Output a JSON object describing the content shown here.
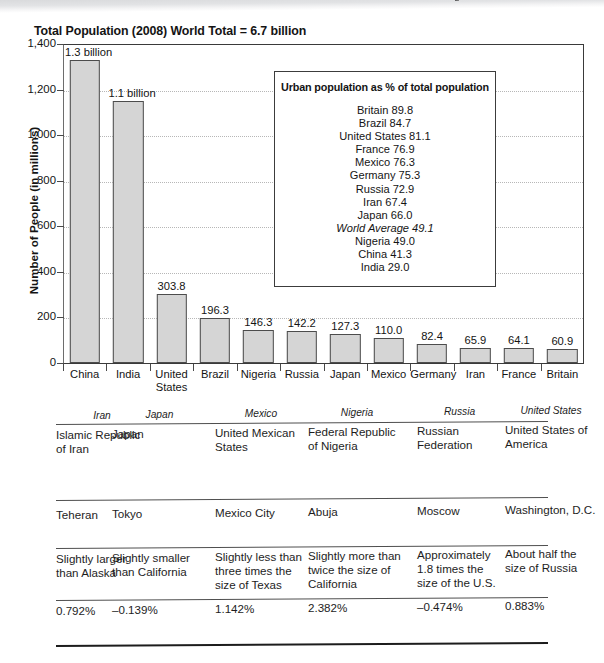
{
  "chart_data": {
    "type": "bar",
    "title": "Total Population (2008) World Total = 6.7 billion",
    "xlabel": "",
    "ylabel": "Number of People (in millions)",
    "ylim": [
      0,
      1400
    ],
    "grid": true,
    "yticks": [
      "0",
      "200",
      "400",
      "600",
      "800",
      "1,000",
      "1,200",
      "1,400"
    ],
    "ytick_values": [
      0,
      200,
      400,
      600,
      800,
      1000,
      1200,
      1400
    ],
    "categories": [
      "China",
      "India",
      "United States",
      "Brazil",
      "Nigeria",
      "Russia",
      "Japan",
      "Mexico",
      "Germany",
      "Iran",
      "France",
      "Britain"
    ],
    "values": [
      1330,
      1150,
      303.8,
      196.3,
      146.3,
      142.2,
      127.3,
      110.0,
      82.4,
      65.9,
      64.1,
      60.9
    ],
    "data_labels": [
      "1.3 billion",
      "1.1 billion",
      "303.8",
      "196.3",
      "146.3",
      "142.2",
      "127.3",
      "110.0",
      "82.4",
      "65.9",
      "64.1",
      "60.9"
    ],
    "bar_color": "#d5d5d5",
    "bar_edge_color": "#4c4c4c"
  },
  "inset": {
    "title": "Urban population as % of total population",
    "rows": [
      {
        "label": "Britain 89.8",
        "italic": false
      },
      {
        "label": "Brazil 84.7",
        "italic": false
      },
      {
        "label": "United States 81.1",
        "italic": false
      },
      {
        "label": "France 76.9",
        "italic": false
      },
      {
        "label": "Mexico 76.3",
        "italic": false
      },
      {
        "label": "Germany 75.3",
        "italic": false
      },
      {
        "label": "Russia 72.9",
        "italic": false
      },
      {
        "label": "Iran 67.4",
        "italic": false
      },
      {
        "label": "Japan 66.0",
        "italic": false
      },
      {
        "label": "World Average 49.1",
        "italic": true
      },
      {
        "label": "Nigeria 49.0",
        "italic": false
      },
      {
        "label": "China 41.3",
        "italic": false
      },
      {
        "label": "India 29.0",
        "italic": false
      }
    ]
  },
  "table": {
    "headers": [
      "Iran",
      "Japan",
      "Mexico",
      "Nigeria",
      "Russia",
      "United States"
    ],
    "rows": [
      {
        "name": "official-name-row",
        "cells": [
          "Islamic Republic of Iran",
          "Japan",
          "United Mexican States",
          "Federal Republic of Nigeria",
          "Russian Federation",
          "United States of America"
        ]
      },
      {
        "name": "capital-row",
        "cells": [
          "Teheran",
          "Tokyo",
          "Mexico City",
          "Abuja",
          "Moscow",
          "Washington, D.C."
        ]
      },
      {
        "name": "area-comparison-row",
        "cells": [
          "Slightly larger than Alaska",
          "Slightly smaller than California",
          "Slightly less than three times the size of Texas",
          "Slightly more than twice the size of California",
          "Approximately 1.8 times the size of the U.S.",
          "About half the size of Russia"
        ]
      },
      {
        "name": "growth-rate-row",
        "cells": [
          "0.792%",
          "–0.139%",
          "1.142%",
          "2.382%",
          "–0.474%",
          "0.883%"
        ]
      }
    ]
  }
}
